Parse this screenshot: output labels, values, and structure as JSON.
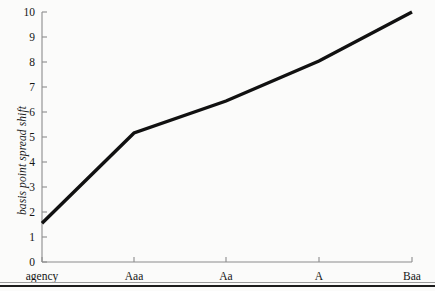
{
  "chart_data": {
    "type": "line",
    "title": "",
    "subtitle": "",
    "xlabel": "",
    "ylabel": "basis point spread shift",
    "categories": [
      "agency",
      "Aaa",
      "Aa",
      "A",
      "Baa"
    ],
    "values": [
      1.55,
      5.16,
      6.44,
      8.04,
      10.0
    ],
    "series": [
      {
        "name": "basis point spread shift",
        "values": [
          1.55,
          5.16,
          6.44,
          8.04,
          10.0
        ]
      }
    ],
    "ylim": [
      0,
      10
    ],
    "xlim_categories": [
      "agency",
      "Baa"
    ],
    "ytick_labels": [
      "0",
      "1",
      "2",
      "3",
      "4",
      "5",
      "6",
      "7",
      "8",
      "9",
      "10"
    ],
    "ytick_values": [
      0,
      1,
      2,
      3,
      4,
      5,
      6,
      7,
      8,
      9,
      10
    ],
    "xtick_labels": [
      "agency",
      "Aaa",
      "Aa",
      "A",
      "Baa"
    ],
    "grid": false,
    "legend": false,
    "legend_position": "none",
    "annotations": []
  },
  "style": {
    "line_color": "#111111",
    "axis_color": "#8c8c8c",
    "text_color": "#151515",
    "background": "#fbfbfa",
    "rule_color": "#1c1c1c",
    "line_width": 3.4
  },
  "geometry": {
    "x_positions": [
      42,
      134,
      226,
      319,
      412
    ],
    "y_zero_px": 262,
    "y_top_px": 12,
    "px_per_unit": 25,
    "axis_x_px": 42,
    "bottom_rule_y": 285,
    "bottom_rule_thin_y": 282
  }
}
